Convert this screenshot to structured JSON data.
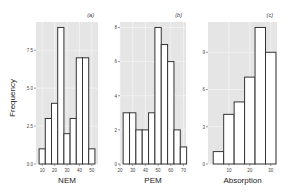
{
  "figure": {
    "ylabel": "Frequency"
  },
  "chart_data": [
    {
      "type": "bar",
      "panel_label": "(a)",
      "title": "",
      "xlabel": "NEM",
      "ylabel": "Frequency",
      "x_ticks": [
        10,
        20,
        30,
        40,
        50
      ],
      "y_ticks": [
        "0.0",
        "2.5",
        "5.0",
        "7.5"
      ],
      "xlim": [
        5,
        55
      ],
      "ylim": [
        0,
        9
      ],
      "bin_width": 5,
      "bin_starts": [
        7.5,
        12.5,
        17.5,
        22.5,
        27.5,
        32.5,
        37.5,
        42.5,
        47.5
      ],
      "values": [
        1,
        3,
        4,
        9,
        2,
        3,
        7,
        7,
        1
      ],
      "grid": true
    },
    {
      "type": "bar",
      "panel_label": "(b)",
      "title": "",
      "xlabel": "PEM",
      "ylabel": "",
      "x_ticks": [
        20,
        30,
        40,
        50,
        60,
        70
      ],
      "y_ticks": [
        "0",
        "2",
        "4",
        "6",
        "8"
      ],
      "xlim": [
        20,
        72
      ],
      "ylim": [
        0,
        8
      ],
      "bin_width": 5,
      "bin_starts": [
        22.5,
        27.5,
        32.5,
        37.5,
        42.5,
        47.5,
        52.5,
        57.5,
        62.5,
        67.5
      ],
      "values": [
        3,
        3,
        2,
        2,
        3,
        8,
        7,
        6,
        2,
        1
      ],
      "grid": true
    },
    {
      "type": "bar",
      "panel_label": "(c)",
      "title": "",
      "xlabel": "Absorption",
      "ylabel": "",
      "x_ticks": [
        10,
        20,
        30
      ],
      "y_ticks": [
        "0",
        "3",
        "6",
        "9"
      ],
      "xlim": [
        0,
        33
      ],
      "ylim": [
        0,
        11
      ],
      "bin_width": 5,
      "bin_starts": [
        2.5,
        7.5,
        12.5,
        17.5,
        22.5,
        27.5
      ],
      "values": [
        1,
        4,
        5,
        7,
        11,
        9
      ],
      "grid": true
    }
  ],
  "colors": {
    "panel_bg": "#e5e5e5",
    "grid": "#f4f4f4",
    "bar_fill": "#ffffff",
    "bar_stroke": "#333333",
    "text": "#444444"
  }
}
